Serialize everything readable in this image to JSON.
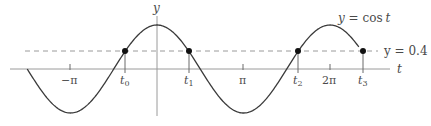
{
  "chart_data": {
    "type": "line",
    "title": "",
    "xlabel": "t",
    "ylabel": "y",
    "curve_label": "y = cos t",
    "threshold_label": "y = 0.4",
    "threshold": 0.4,
    "x_range": [
      -4.712,
      7.33
    ],
    "y_range": [
      -1,
      1
    ],
    "x_ticks": [
      {
        "label": "−π",
        "value": -3.1416
      },
      {
        "label": "t0",
        "value": -1.1593
      },
      {
        "label": "t1",
        "value": 1.1593
      },
      {
        "label": "π",
        "value": 3.1416
      },
      {
        "label": "t2",
        "value": 5.1239
      },
      {
        "label": "2π",
        "value": 6.2832
      },
      {
        "label": "t3",
        "value": 7.4425
      }
    ],
    "intersection_points": [
      {
        "name": "t0",
        "x": -1.1593,
        "y": 0.4
      },
      {
        "name": "t1",
        "x": 1.1593,
        "y": 0.4
      },
      {
        "name": "t2",
        "x": 5.1239,
        "y": 0.4
      },
      {
        "name": "t3",
        "x": 7.4425,
        "y": 0.4
      }
    ],
    "grid": false,
    "legend": "none"
  },
  "labels": {
    "y_axis": "y",
    "t_axis": "t",
    "curve": {
      "lhs": "y = ",
      "fn": "cos",
      "arg": "t"
    },
    "threshold": "y = 0.4",
    "neg_pi": "−π",
    "pi": "π",
    "two_pi": "2π",
    "t0": {
      "base": "t",
      "sub": "0"
    },
    "t1": {
      "base": "t",
      "sub": "1"
    },
    "t2": {
      "base": "t",
      "sub": "2"
    },
    "t3": {
      "base": "t",
      "sub": "3"
    }
  },
  "colors": {
    "axis": "#9a9a9a",
    "curve": "#3a3a3a",
    "dashed": "#9a9a9a",
    "point": "#111111",
    "text": "#4a4a4a"
  }
}
